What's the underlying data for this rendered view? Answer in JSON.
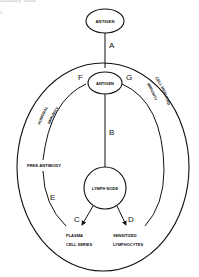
{
  "bleed_text": {
    "top_fragment": "mmunity Sinai",
    "side_fragment": "s"
  },
  "nodes": {
    "antigen_outer": "ANTIGEN",
    "antigen_inner": "ANTIGEN",
    "lymph_node": "LYMPH NODE",
    "plasma_line1": "PLASMA",
    "plasma_line2": "CELL SERIES",
    "sensitized_line1": "SENSITIZED",
    "sensitized_line2": "LYMPHOCYTES",
    "free_antibody": "FREE ANTIBODY"
  },
  "arc_labels": {
    "humoral": "HUMORAL",
    "humoral_immunity": "IMMUNITY",
    "cell_mediated": "CELL MEDIATED",
    "cell_mediated_immunity": "IMMUNITY"
  },
  "path_letters": {
    "A": "A",
    "B": "B",
    "C": "C",
    "D": "D",
    "E": "E",
    "F": "F",
    "G": "G"
  },
  "colors": {
    "stroke": "#111111",
    "background": "#ffffff"
  }
}
